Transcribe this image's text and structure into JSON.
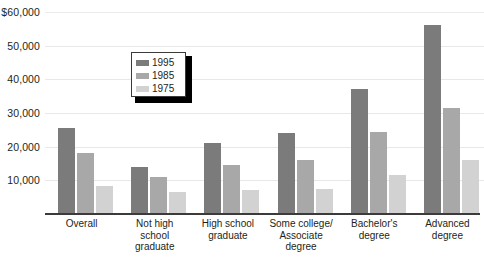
{
  "chart_data": {
    "type": "bar",
    "title": "",
    "xlabel": "",
    "ylabel": "",
    "ylim": [
      0,
      60000
    ],
    "grid": true,
    "legend_position": "inside-upper-left",
    "categories": [
      "Overall",
      "Not high\nschool\ngraduate",
      "High school\ngraduate",
      "Some college/\nAssociate\ndegree",
      "Bachelor's\ndegree",
      "Advanced\ndegree"
    ],
    "series": [
      {
        "name": "1995",
        "color": "#7b7b7b",
        "values": [
          25500,
          14000,
          21000,
          24000,
          37000,
          56000
        ]
      },
      {
        "name": "1985",
        "color": "#a8a8a8",
        "values": [
          18000,
          11000,
          14500,
          16000,
          24500,
          31500
        ]
      },
      {
        "name": "1975",
        "color": "#d2d2d2",
        "values": [
          8300,
          6500,
          7000,
          7500,
          11500,
          16000
        ]
      }
    ],
    "y_ticks": [
      {
        "value": 60000,
        "label": "$60,000"
      },
      {
        "value": 50000,
        "label": "50,000"
      },
      {
        "value": 40000,
        "label": "40,000"
      },
      {
        "value": 30000,
        "label": "30,000"
      },
      {
        "value": 20000,
        "label": "20,000"
      },
      {
        "value": 10000,
        "label": "10,000"
      }
    ]
  },
  "legend": {
    "items": [
      {
        "label": "1995"
      },
      {
        "label": "1985"
      },
      {
        "label": "1975"
      }
    ]
  }
}
